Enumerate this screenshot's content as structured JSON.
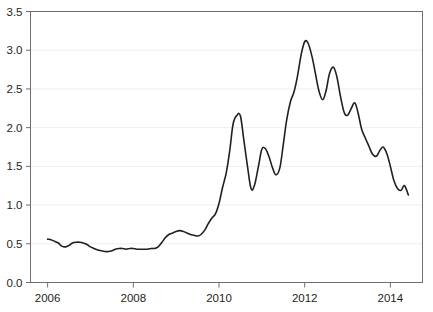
{
  "chart_data": {
    "type": "line",
    "title": "",
    "subtitle": "",
    "xlabel": "",
    "ylabel": "",
    "legend": [],
    "legend_position": "none",
    "grid": true,
    "grid_axis": "y",
    "grid_color": "#eeeeee",
    "line_color": "#231f20",
    "line_width": 1.6,
    "background_color": "#ffffff",
    "axis_color": "#6d6e71",
    "xlim": [
      2005.6,
      2014.75
    ],
    "ylim": [
      0.0,
      3.5
    ],
    "yticks": [
      0.0,
      0.5,
      1.0,
      1.5,
      2.0,
      2.5,
      3.0,
      3.5
    ],
    "ytick_labels": [
      "0.0",
      "0.5",
      "1.0",
      "1.5",
      "2.0",
      "2.5",
      "3.0",
      "3.5"
    ],
    "xticks": [
      2006,
      2008,
      2010,
      2012,
      2014
    ],
    "xtick_labels": [
      "2006",
      "2008",
      "2010",
      "2012",
      "2014"
    ],
    "series": [
      {
        "name": "series-1",
        "x": [
          2006.0,
          2006.09,
          2006.17,
          2006.25,
          2006.33,
          2006.42,
          2006.5,
          2006.58,
          2006.67,
          2006.75,
          2006.83,
          2006.92,
          2007.0,
          2007.08,
          2007.17,
          2007.25,
          2007.33,
          2007.42,
          2007.5,
          2007.58,
          2007.67,
          2007.75,
          2007.83,
          2007.92,
          2008.0,
          2008.08,
          2008.17,
          2008.25,
          2008.33,
          2008.42,
          2008.5,
          2008.58,
          2008.67,
          2008.75,
          2008.83,
          2008.92,
          2009.0,
          2009.08,
          2009.17,
          2009.25,
          2009.33,
          2009.42,
          2009.5,
          2009.58,
          2009.67,
          2009.75,
          2009.83,
          2009.92,
          2010.0,
          2010.08,
          2010.17,
          2010.25,
          2010.33,
          2010.42,
          2010.5,
          2010.58,
          2010.67,
          2010.75,
          2010.83,
          2010.92,
          2011.0,
          2011.08,
          2011.17,
          2011.25,
          2011.33,
          2011.42,
          2011.5,
          2011.58,
          2011.67,
          2011.75,
          2011.83,
          2011.92,
          2012.0,
          2012.08,
          2012.17,
          2012.25,
          2012.33,
          2012.42,
          2012.5,
          2012.58,
          2012.67,
          2012.75,
          2012.83,
          2012.92,
          2013.0,
          2013.08,
          2013.17,
          2013.25,
          2013.33,
          2013.42,
          2013.5,
          2013.58,
          2013.67,
          2013.75,
          2013.83,
          2013.92
        ],
        "values": [
          0.56,
          0.55,
          0.53,
          0.51,
          0.47,
          0.46,
          0.48,
          0.51,
          0.52,
          0.52,
          0.51,
          0.49,
          0.46,
          0.44,
          0.42,
          0.41,
          0.4,
          0.4,
          0.41,
          0.43,
          0.44,
          0.44,
          0.43,
          0.44,
          0.44,
          0.43,
          0.43,
          0.43,
          0.43,
          0.44,
          0.44,
          0.46,
          0.52,
          0.58,
          0.62,
          0.64,
          0.66,
          0.67,
          0.66,
          0.64,
          0.62,
          0.61,
          0.6,
          0.62,
          0.68,
          0.76,
          0.83,
          0.89,
          1.02,
          1.22,
          1.42,
          1.7,
          2.05,
          2.16,
          2.15,
          1.84,
          1.48,
          1.21,
          1.26,
          1.5,
          1.72,
          1.73,
          1.62,
          1.48,
          1.39,
          1.48,
          1.78,
          2.1,
          2.34,
          2.46,
          2.66,
          2.95,
          3.11,
          3.09,
          2.92,
          2.7,
          2.48,
          2.36,
          2.48,
          2.7,
          2.78,
          2.66,
          2.42,
          2.2,
          2.16,
          2.24,
          2.32,
          2.18,
          1.98,
          1.86,
          1.76,
          1.66,
          1.63,
          1.7,
          1.75,
          1.66
        ],
        "tail_x": [
          2013.92,
          2014.0,
          2014.08,
          2014.17,
          2014.25,
          2014.33,
          2014.42
        ],
        "tail_values": [
          1.66,
          1.5,
          1.32,
          1.21,
          1.19,
          1.25,
          1.13
        ]
      }
    ]
  }
}
